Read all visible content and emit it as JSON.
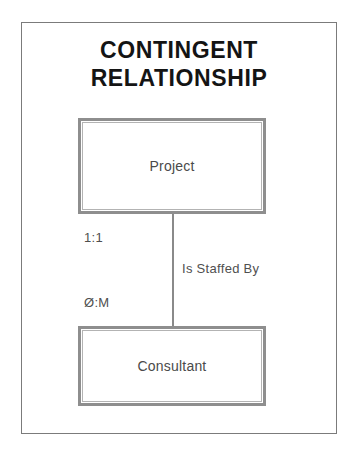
{
  "diagram": {
    "title": "CONTINGENT\nRELATIONSHIP",
    "entities": [
      {
        "id": "project",
        "label": "Project"
      },
      {
        "id": "consultant",
        "label": "Consultant"
      }
    ],
    "relationship": {
      "label": "Is Staffed By",
      "cardinality_near": "1:1",
      "cardinality_far": "Ø:M"
    },
    "colors": {
      "frame_border": "#7b7b7b",
      "entity_border": "#8e8e8e",
      "connector": "#8a8a8a",
      "title_text": "#141414",
      "body_text": "#4a4a4a",
      "background": "#ffffff"
    }
  }
}
